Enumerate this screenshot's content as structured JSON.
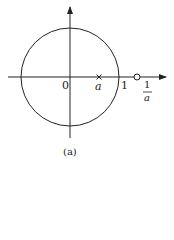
{
  "figure": {
    "caption": "(a)",
    "labels": {
      "origin": "0",
      "zero_point": "a",
      "unit": "1",
      "pole_numerator": "1",
      "pole_denominator": "a"
    },
    "elements": {
      "unit_circle": "circle centered at origin, radius 1",
      "pole_marker": "×",
      "zero_marker": "o"
    },
    "colors": {
      "stroke": "#222222",
      "background": "#ffffff"
    }
  }
}
